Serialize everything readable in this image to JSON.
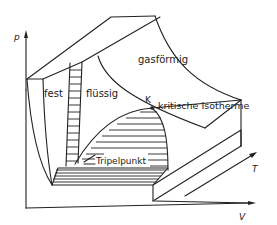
{
  "diagram": {
    "axes": {
      "p": "p",
      "T": "T",
      "V": "V"
    },
    "regions": {
      "solid": "fest",
      "liquid": "flüssig",
      "gas": "gasförmig"
    },
    "points": {
      "critical": "K",
      "triple": "Tripelpunkt"
    },
    "curves": {
      "critical_isotherm": "kritische Isotherme"
    },
    "colors": {
      "line": "#222222",
      "background": "#ffffff"
    }
  }
}
